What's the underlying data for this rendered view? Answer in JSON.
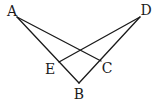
{
  "diagram": {
    "type": "geometry",
    "points": {
      "A": {
        "label": "A",
        "x": 17,
        "y": 17,
        "lx": 12,
        "ly": 16
      },
      "D": {
        "label": "D",
        "x": 140,
        "y": 17,
        "lx": 146,
        "ly": 15
      },
      "B": {
        "label": "B",
        "x": 79,
        "y": 83,
        "lx": 79,
        "ly": 99
      },
      "E": {
        "label": "E",
        "x": 59,
        "y": 62,
        "lx": 50,
        "ly": 74
      },
      "C": {
        "label": "C",
        "x": 101,
        "y": 61,
        "lx": 107,
        "ly": 73
      }
    },
    "segments": [
      {
        "from": "A",
        "to": "B"
      },
      {
        "from": "A",
        "to": "C"
      },
      {
        "from": "D",
        "to": "B"
      },
      {
        "from": "D",
        "to": "E"
      }
    ],
    "labels": {
      "A": "A",
      "B": "B",
      "C": "C",
      "D": "D",
      "E": "E"
    }
  }
}
